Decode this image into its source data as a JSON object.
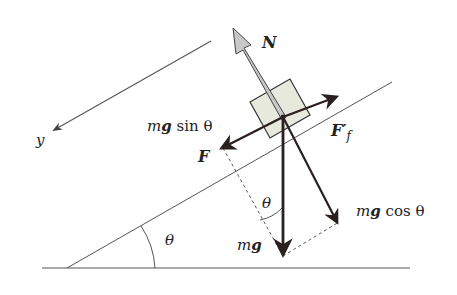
{
  "diagram": {
    "labels": {
      "normal": "N",
      "gravity": "mg",
      "gravity_m": "m",
      "gravity_g": "g",
      "parallel_m": "m",
      "parallel_g": "g",
      "parallel_fn": " sin θ",
      "perp_m": "m",
      "perp_g": "g",
      "perp_fn": " cos θ",
      "applied": "F",
      "friction": "F′",
      "friction_sub": "f",
      "axis": "y",
      "angle_incline": "θ",
      "angle_gravity": "θ"
    },
    "colors": {
      "line": "#444444",
      "force": "#2a2020",
      "normal_fill": "#c8c8c8",
      "block_fill": "#e6e9dc",
      "dashed": "#555555"
    }
  }
}
